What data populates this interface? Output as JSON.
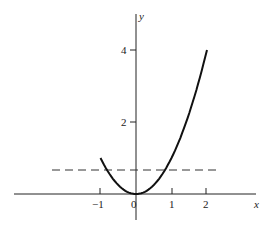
{
  "chart_data": {
    "type": "line",
    "title": "",
    "xlabel": "x",
    "ylabel": "y",
    "xlim": [
      -3.7,
      3.8
    ],
    "ylim": [
      -0.75,
      5.0
    ],
    "x_ticks": [
      "-1",
      "0",
      "1",
      "2"
    ],
    "y_ticks": [
      "2",
      "4"
    ],
    "grid": false,
    "series": [
      {
        "name": "y = x^2",
        "style": "solid",
        "x": [
          -1,
          -0.5,
          0,
          0.5,
          1,
          1.5,
          2
        ],
        "y": [
          1,
          0.25,
          0,
          0.25,
          1,
          2.25,
          4
        ]
      },
      {
        "name": "horizontal reference",
        "style": "dashed",
        "x": [
          -2.3,
          2.3
        ],
        "y": [
          0.67,
          0.67
        ]
      }
    ]
  },
  "labels": {
    "x_axis": "x",
    "y_axis": "y",
    "tick_neg1": "−1",
    "tick_0": "0",
    "tick_1": "1",
    "tick_2": "2",
    "tick_y2": "2",
    "tick_y4": "4"
  }
}
